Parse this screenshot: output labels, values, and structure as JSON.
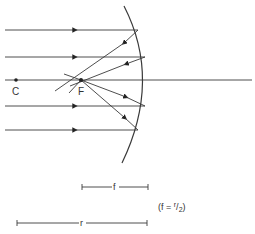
{
  "diagram": {
    "labels": {
      "center": "C",
      "focus": "F",
      "focal_length": "f",
      "radius": "r",
      "relation_prefix": "(f = ",
      "relation_num": "r",
      "relation_den": "2",
      "relation_suffix": ")"
    },
    "colors": {
      "line": "#3a3a3a",
      "background": "#ffffff"
    }
  }
}
